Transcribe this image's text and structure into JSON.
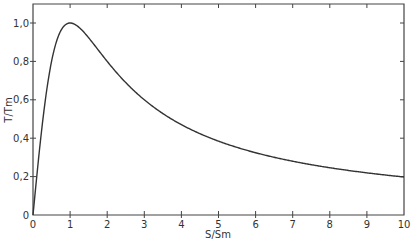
{
  "chart_data": {
    "type": "line",
    "title": "",
    "xlabel": "S/S_m",
    "ylabel": "T/T_m",
    "xlim": [
      0,
      10
    ],
    "ylim": [
      0,
      1.1
    ],
    "grid": false,
    "legend": null,
    "x_ticks": [
      "0",
      "1",
      "2",
      "3",
      "4",
      "5",
      "6",
      "7",
      "8",
      "9",
      "10"
    ],
    "y_ticks": [
      "0",
      "0,2",
      "0,4",
      "0,6",
      "0,8",
      "1,0"
    ],
    "series": [
      {
        "name": "T/T_m",
        "x": [
          0,
          0.1,
          0.2,
          0.3,
          0.4,
          0.5,
          0.6,
          0.7,
          0.8,
          0.9,
          1.0,
          1.2,
          1.4,
          1.6,
          1.8,
          2.0,
          2.5,
          3.0,
          3.5,
          4.0,
          4.5,
          5.0,
          5.5,
          6.0,
          6.5,
          7.0,
          7.5,
          8.0,
          8.5,
          9.0,
          9.5,
          10.0
        ],
        "values": [
          0,
          0.198,
          0.385,
          0.55,
          0.69,
          0.8,
          0.882,
          0.94,
          0.976,
          0.994,
          1.0,
          0.984,
          0.946,
          0.899,
          0.85,
          0.8,
          0.69,
          0.6,
          0.528,
          0.471,
          0.424,
          0.385,
          0.353,
          0.324,
          0.301,
          0.28,
          0.262,
          0.246,
          0.232,
          0.22,
          0.209,
          0.198
        ]
      }
    ]
  }
}
